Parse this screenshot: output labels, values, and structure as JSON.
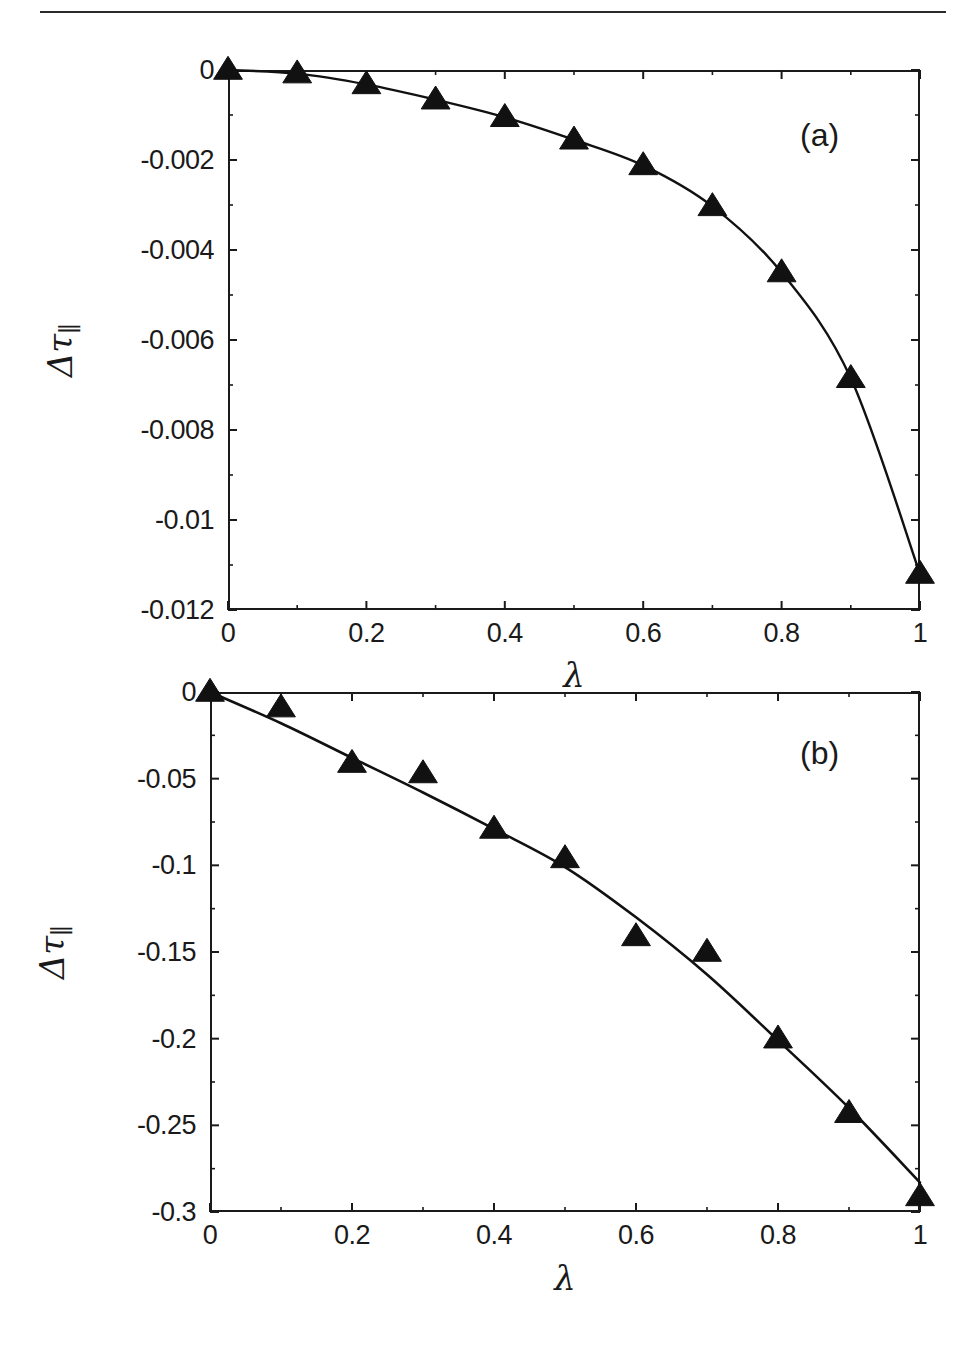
{
  "document": {
    "header_fragment": "",
    "rule_color": "#2a2a2a"
  },
  "figure": {
    "line_color": "#111111",
    "marker_color": "#111111",
    "axis_color": "#1a1a1a"
  },
  "panels": [
    {
      "tag": "(a)",
      "xlabel": "λ",
      "ylabel_delta": "Δ",
      "ylabel_tau": "τ",
      "ylabel_sub": "∥",
      "xticks": [
        "0",
        "0.2",
        "0.4",
        "0.6",
        "0.8",
        "1"
      ],
      "yticks": [
        "0",
        "-0.002",
        "-0.004",
        "-0.006",
        "-0.008",
        "-0.01",
        "-0.012"
      ]
    },
    {
      "tag": "(b)",
      "xlabel": "λ",
      "ylabel_delta": "Δ",
      "ylabel_tau": "τ",
      "ylabel_sub": "∥",
      "xticks": [
        "0",
        "0.2",
        "0.4",
        "0.6",
        "0.8",
        "1"
      ],
      "yticks": [
        "0",
        "-0.05",
        "-0.1",
        "-0.15",
        "-0.2",
        "-0.25",
        "-0.3"
      ]
    }
  ],
  "chart_data": [
    {
      "type": "line",
      "panel": "(a)",
      "title": "",
      "xlabel": "λ",
      "ylabel": "Δτ∥",
      "xlim": [
        0,
        1
      ],
      "ylim": [
        -0.012,
        0
      ],
      "xticks": [
        0,
        0.2,
        0.4,
        0.6,
        0.8,
        1
      ],
      "yticks": [
        0,
        -0.002,
        -0.004,
        -0.006,
        -0.008,
        -0.01,
        -0.012
      ],
      "grid": false,
      "legend": "none",
      "series": [
        {
          "name": "Δτ∥ vs λ",
          "marker": "triangle-up",
          "line": "solid",
          "x": [
            0,
            0.1,
            0.2,
            0.3,
            0.4,
            0.5,
            0.6,
            0.7,
            0.8,
            0.9,
            1.0
          ],
          "values": [
            0.0,
            -8e-05,
            -0.00032,
            -0.00066,
            -0.00105,
            -0.00155,
            -0.00212,
            -0.00303,
            -0.0045,
            -0.00685,
            -0.0112
          ]
        }
      ]
    },
    {
      "type": "line",
      "panel": "(b)",
      "title": "",
      "xlabel": "λ",
      "ylabel": "Δτ∥",
      "xlim": [
        0,
        1
      ],
      "ylim": [
        -0.3,
        0
      ],
      "xticks": [
        0,
        0.2,
        0.4,
        0.6,
        0.8,
        1
      ],
      "yticks": [
        0,
        -0.05,
        -0.1,
        -0.15,
        -0.2,
        -0.25,
        -0.3
      ],
      "grid": false,
      "legend": "none",
      "series": [
        {
          "name": "Δτ∥ vs λ (fit curve)",
          "marker": "none",
          "line": "solid",
          "x": [
            0,
            0.1,
            0.2,
            0.3,
            0.4,
            0.5,
            0.6,
            0.7,
            0.8,
            0.9,
            1.0
          ],
          "values": [
            0.0,
            -0.018,
            -0.038,
            -0.058,
            -0.079,
            -0.101,
            -0.13,
            -0.163,
            -0.201,
            -0.24,
            -0.283
          ]
        },
        {
          "name": "Δτ∥ measured points",
          "marker": "triangle-up",
          "line": "none",
          "x": [
            0,
            0.1,
            0.2,
            0.3,
            0.4,
            0.5,
            0.6,
            0.7,
            0.8,
            0.9,
            1.0
          ],
          "values": [
            0.0,
            -0.009,
            -0.041,
            -0.047,
            -0.079,
            -0.096,
            -0.141,
            -0.15,
            -0.2,
            -0.243,
            -0.291
          ]
        }
      ]
    }
  ]
}
